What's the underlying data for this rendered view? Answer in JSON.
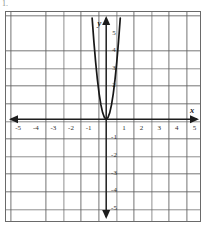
{
  "problem": {
    "number": "1."
  },
  "graph": {
    "axes": {
      "x_label": "x",
      "y_label": "y",
      "x_ticks": [
        "-5",
        "-4",
        "-3",
        "-2",
        "-1",
        "1",
        "2",
        "3",
        "4",
        "5"
      ],
      "y_ticks": [
        "5",
        "4",
        "3",
        "2",
        "-1",
        "-2",
        "-3",
        "-4",
        "-5"
      ],
      "arrowheads": [
        "x-positive",
        "x-negative",
        "y-positive",
        "y-negative"
      ]
    },
    "colors": {
      "curve": "#171717",
      "axis": "#1d1d1d",
      "grid_minor": "#969696",
      "grid_major": "#5f5f5f",
      "border": "#6a6a6a",
      "background": "#ffffff"
    },
    "icons": {
      "x_arrow_right": "arrow-right-icon",
      "x_arrow_left": "arrow-left-icon",
      "y_arrow_up": "arrow-up-icon",
      "y_arrow_down": "arrow-down-icon"
    }
  },
  "chart_data": {
    "type": "line",
    "title": "",
    "xlabel": "x",
    "ylabel": "y",
    "xlim": [
      -5.5,
      5.5
    ],
    "ylim": [
      -5.5,
      5.5
    ],
    "grid": true,
    "legend": "none",
    "series": [
      {
        "name": "parabola",
        "equation": "y = 9x^2",
        "vertex": [
          0,
          0
        ],
        "opens": "up",
        "x": [
          -0.79,
          -0.7,
          -0.6,
          -0.5,
          -0.4,
          -0.3,
          -0.2,
          -0.1,
          0,
          0.1,
          0.2,
          0.3,
          0.4,
          0.5,
          0.6,
          0.7,
          0.79
        ],
        "y": [
          5.62,
          4.41,
          3.24,
          2.25,
          1.44,
          0.81,
          0.36,
          0.09,
          0,
          0.09,
          0.36,
          0.81,
          1.44,
          2.25,
          3.24,
          4.41,
          5.62
        ]
      }
    ],
    "xticks": [
      -5,
      -4,
      -3,
      -2,
      -1,
      1,
      2,
      3,
      4,
      5
    ],
    "yticks": [
      5,
      4,
      3,
      2,
      -1,
      -2,
      -3,
      -4,
      -5
    ]
  }
}
